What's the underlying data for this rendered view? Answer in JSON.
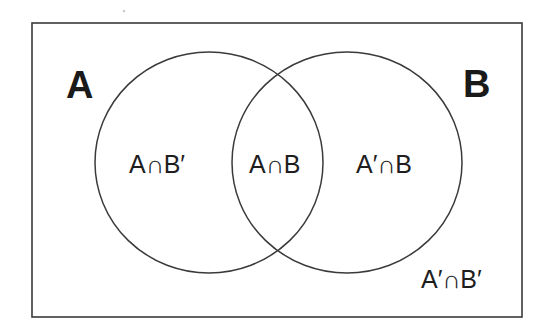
{
  "diagram": {
    "type": "venn",
    "universe": {
      "x": 32,
      "y": 23,
      "width": 490,
      "height": 294,
      "stroke": "#3a3a3a"
    },
    "sets": [
      {
        "id": "A",
        "label": "A",
        "cx": 209,
        "cy": 162.5,
        "rx": 114,
        "ry": 110.5,
        "label_x": 67,
        "label_y": 98
      },
      {
        "id": "B",
        "label": "B",
        "cx": 347,
        "cy": 162.5,
        "rx": 115,
        "ry": 110.5,
        "label_x": 464,
        "label_y": 97
      }
    ],
    "regions": [
      {
        "id": "a_only",
        "label": "A∩B′",
        "x": 129,
        "y": 173
      },
      {
        "id": "a_and_b",
        "label": "A∩B",
        "x": 249,
        "y": 173
      },
      {
        "id": "b_only",
        "label": "A′∩B",
        "x": 356,
        "y": 173
      },
      {
        "id": "neither",
        "label": "A′∩B′",
        "x": 421,
        "y": 288
      }
    ],
    "colors": {
      "line": "#3a3a3a",
      "text": "#1e1e1e",
      "background": "#ffffff"
    }
  }
}
